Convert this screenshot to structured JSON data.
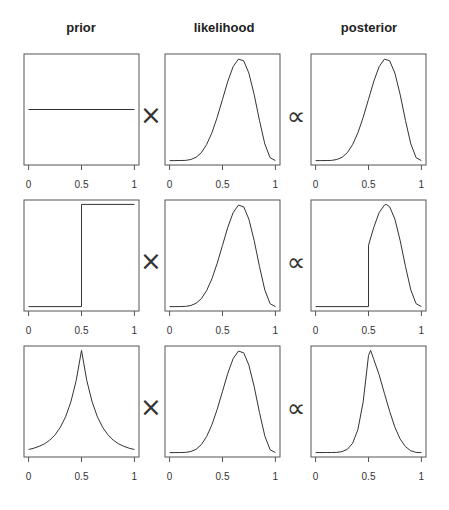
{
  "columns": [
    "prior",
    "likelihood",
    "posterior"
  ],
  "operators": {
    "times": "×",
    "proportional": "∝"
  },
  "axis": {
    "ticks": [
      0,
      0.5,
      1
    ],
    "tick_labels": [
      "0",
      "0.5",
      "1"
    ]
  },
  "layout": {
    "col_x": [
      24,
      165,
      311
    ],
    "row_y": [
      54,
      200,
      346
    ],
    "box_w": 115,
    "box_h": 111,
    "line_color": "#333333",
    "box_color": "#555555"
  },
  "chart_data": {
    "type": "line",
    "title": "",
    "xlabel": "",
    "ylabel": "",
    "xlim": [
      0,
      1
    ],
    "x": [
      0,
      0.05,
      0.1,
      0.15,
      0.2,
      0.25,
      0.3,
      0.35,
      0.4,
      0.45,
      0.5,
      0.55,
      0.6,
      0.65,
      0.7,
      0.75,
      0.8,
      0.85,
      0.9,
      0.95,
      1
    ],
    "rows": [
      {
        "prior": {
          "name": "uniform",
          "points": [
            [
              0,
              0.5
            ],
            [
              1,
              0.5
            ]
          ]
        },
        "likelihood": {
          "values": [
            0,
            0,
            0.0002,
            0.002,
            0.01,
            0.032,
            0.077,
            0.156,
            0.272,
            0.424,
            0.6,
            0.776,
            0.919,
            0.994,
            0.977,
            0.855,
            0.645,
            0.391,
            0.163,
            0.028,
            0
          ]
        },
        "posterior": {
          "values": [
            0,
            0,
            0.0002,
            0.002,
            0.01,
            0.032,
            0.077,
            0.156,
            0.272,
            0.424,
            0.6,
            0.776,
            0.919,
            0.994,
            0.977,
            0.855,
            0.645,
            0.391,
            0.163,
            0.028,
            0
          ]
        }
      },
      {
        "prior": {
          "name": "step at 0.5",
          "points": [
            [
              0,
              0
            ],
            [
              0.5,
              0
            ],
            [
              0.5,
              1
            ],
            [
              1,
              1
            ]
          ]
        },
        "likelihood": {
          "values": [
            0,
            0,
            0.0002,
            0.002,
            0.01,
            0.032,
            0.077,
            0.156,
            0.272,
            0.424,
            0.6,
            0.776,
            0.919,
            0.994,
            0.977,
            0.855,
            0.645,
            0.391,
            0.163,
            0.028,
            0
          ]
        },
        "posterior": {
          "points": [
            [
              0,
              0
            ],
            [
              0.5,
              0
            ],
            [
              0.5,
              0.6
            ],
            [
              0.55,
              0.776
            ],
            [
              0.6,
              0.919
            ],
            [
              0.65,
              0.994
            ],
            [
              0.667,
              1.0
            ],
            [
              0.7,
              0.977
            ],
            [
              0.75,
              0.855
            ],
            [
              0.8,
              0.645
            ],
            [
              0.85,
              0.391
            ],
            [
              0.9,
              0.163
            ],
            [
              0.95,
              0.028
            ],
            [
              1,
              0
            ]
          ]
        }
      },
      {
        "prior": {
          "name": "laplace peaked at 0.5",
          "values": [
            0.03,
            0.043,
            0.061,
            0.086,
            0.122,
            0.174,
            0.247,
            0.35,
            0.497,
            0.705,
            1.0,
            0.705,
            0.497,
            0.35,
            0.247,
            0.174,
            0.122,
            0.086,
            0.061,
            0.043,
            0.03
          ]
        },
        "likelihood": {
          "values": [
            0,
            0,
            0.0002,
            0.002,
            0.01,
            0.032,
            0.077,
            0.156,
            0.272,
            0.424,
            0.6,
            0.776,
            0.919,
            0.994,
            0.977,
            0.855,
            0.645,
            0.391,
            0.163,
            0.028,
            0
          ]
        },
        "posterior": {
          "points": [
            [
              0,
              0
            ],
            [
              0.1,
              0.0003
            ],
            [
              0.15,
              0.0003
            ],
            [
              0.2,
              0.002
            ],
            [
              0.25,
              0.0093
            ],
            [
              0.3,
              0.032
            ],
            [
              0.35,
              0.091
            ],
            [
              0.4,
              0.225
            ],
            [
              0.45,
              0.498
            ],
            [
              0.5,
              0.95
            ],
            [
              0.52,
              1.0
            ],
            [
              0.55,
              0.912
            ],
            [
              0.6,
              0.762
            ],
            [
              0.65,
              0.58
            ],
            [
              0.7,
              0.402
            ],
            [
              0.75,
              0.248
            ],
            [
              0.8,
              0.132
            ],
            [
              0.85,
              0.057
            ],
            [
              0.9,
              0.017
            ],
            [
              0.95,
              0.002
            ],
            [
              1,
              0
            ]
          ]
        }
      }
    ]
  }
}
